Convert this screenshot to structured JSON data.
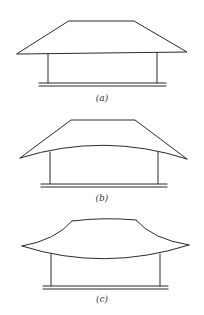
{
  "figure": {
    "type": "roof-profile-comparison",
    "stroke_color": "#2a2a2a",
    "background": "#ffffff",
    "panels": [
      {
        "id": "a",
        "label": "(a)",
        "roof_shape": "straight hip / trapezoid"
      },
      {
        "id": "b",
        "label": "(b)",
        "roof_shape": "straight upper slopes with upward-arched eave line"
      },
      {
        "id": "c",
        "label": "(c)",
        "roof_shape": "concave curved slopes with upturned eaves"
      }
    ]
  }
}
